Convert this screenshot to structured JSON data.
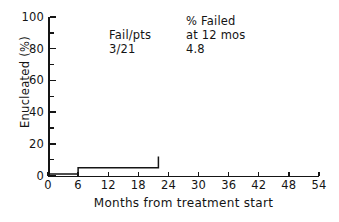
{
  "chart_data": {
    "type": "line",
    "subtype": "kaplan-meier-step",
    "title": "",
    "xlabel": "Months from treatment start",
    "ylabel": "Enucleated (%)",
    "xlim": [
      0,
      54
    ],
    "ylim": [
      0,
      100
    ],
    "xticks": [
      0,
      6,
      12,
      18,
      24,
      30,
      36,
      42,
      48,
      54
    ],
    "yticks": [
      0,
      20,
      40,
      60,
      80,
      100
    ],
    "y_minor_ticks": [
      10,
      30,
      50,
      70,
      90
    ],
    "grid": false,
    "legend": "none",
    "series": [
      {
        "name": "Enucleated",
        "step": "post",
        "x": [
          0,
          6,
          6,
          22,
          22
        ],
        "y": [
          1,
          1,
          5,
          5,
          12
        ],
        "points": [
          {
            "months": 0,
            "percent": 1
          },
          {
            "months": 6,
            "percent": 1
          },
          {
            "months": 6,
            "percent": 5
          },
          {
            "months": 22,
            "percent": 5
          },
          {
            "months": 22,
            "percent": 12
          }
        ],
        "color": "#151515"
      }
    ],
    "annotations": [
      {
        "id": "fail-per-pts",
        "lines": [
          "Fail/pts",
          "3/21"
        ],
        "x_months": 12.5,
        "y_percent": 90
      },
      {
        "id": "percent-failed-at-12-months",
        "lines": [
          "% Failed",
          "at 12 mos",
          "4.8"
        ],
        "x_months": 27.5,
        "y_percent": 98
      }
    ]
  },
  "axes": {
    "y": {
      "label": "Enucleated (%)",
      "ticks": [
        {
          "value": 100,
          "label": "100",
          "major": true
        },
        {
          "value": 90,
          "label": "",
          "major": false
        },
        {
          "value": 80,
          "label": "80",
          "major": true
        },
        {
          "value": 70,
          "label": "",
          "major": false
        },
        {
          "value": 60,
          "label": "60",
          "major": true
        },
        {
          "value": 50,
          "label": "",
          "major": false
        },
        {
          "value": 40,
          "label": "40",
          "major": true
        },
        {
          "value": 30,
          "label": "",
          "major": false
        },
        {
          "value": 20,
          "label": "20",
          "major": true
        },
        {
          "value": 10,
          "label": "",
          "major": false
        },
        {
          "value": 0,
          "label": "0",
          "major": true
        }
      ]
    },
    "x": {
      "label": "Months from treatment start",
      "ticks": [
        {
          "value": 0,
          "label": "0"
        },
        {
          "value": 6,
          "label": "6"
        },
        {
          "value": 12,
          "label": "12"
        },
        {
          "value": 18,
          "label": "18"
        },
        {
          "value": 24,
          "label": "24"
        },
        {
          "value": 30,
          "label": "30"
        },
        {
          "value": 36,
          "label": "36"
        },
        {
          "value": 42,
          "label": "42"
        },
        {
          "value": 48,
          "label": "48"
        },
        {
          "value": 54,
          "label": "54"
        }
      ]
    }
  },
  "annotations": {
    "fail_pts": {
      "header": "Fail/pts",
      "value": "3/21"
    },
    "pct_failed": {
      "header_line1": "% Failed",
      "header_line2": "at 12 mos",
      "value": "4.8"
    }
  },
  "colors": {
    "ink": "#151515",
    "background": "#ffffff"
  }
}
